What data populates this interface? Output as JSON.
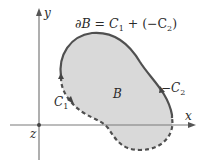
{
  "diagram": {
    "title_parts": {
      "partial_b": "∂B = C",
      "sub1": "1",
      "mid": " + (−C",
      "sub2": "2",
      "end": ")"
    },
    "axes": {
      "x_label": "x",
      "y_label": "y",
      "origin_label": "z"
    },
    "region_label": "B",
    "curve_c1": {
      "label": "C",
      "sub": "1",
      "style": "dashed"
    },
    "curve_c2": {
      "label": "−C",
      "sub": "2",
      "style": "solid"
    },
    "colors": {
      "region_fill": "#d9d9d9",
      "curve": "#505050",
      "axis": "#7a7a7a"
    }
  }
}
